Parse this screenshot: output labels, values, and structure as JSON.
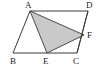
{
  "figure": {
    "background_color": "#ffffff",
    "stroke_color": "#3a3a3a",
    "shade_color": "#c9c9c9",
    "shade_stroke_color": "#555555",
    "stroke_width": 1,
    "canvas": {
      "width": 103,
      "height": 70
    },
    "points": {
      "A": {
        "x": 30,
        "y": 11,
        "label": "A",
        "label_x": 25,
        "label_y": 1
      },
      "B": {
        "x": 13,
        "y": 53,
        "label": "B",
        "label_x": 10,
        "label_y": 57
      },
      "C": {
        "x": 77,
        "y": 53,
        "label": "C",
        "label_x": 73,
        "label_y": 57
      },
      "D": {
        "x": 88,
        "y": 11,
        "label": "D",
        "label_x": 86,
        "label_y": 1
      },
      "E": {
        "x": 47,
        "y": 53,
        "label": "E",
        "label_x": 43,
        "label_y": 57
      },
      "F": {
        "x": 84,
        "y": 35,
        "label": "F",
        "label_x": 87,
        "label_y": 31
      }
    },
    "outline_polygon": "30,11 88,11 77,53 13,53",
    "shaded_polygon": "30,11 84,35 47,53",
    "segments": [
      {
        "name": "AB",
        "from": "A",
        "to": "B"
      },
      {
        "name": "AD",
        "from": "A",
        "to": "D"
      },
      {
        "name": "DC",
        "from": "D",
        "to": "C"
      },
      {
        "name": "BC",
        "from": "B",
        "to": "C"
      },
      {
        "name": "AE",
        "from": "A",
        "to": "E"
      },
      {
        "name": "AF",
        "from": "A",
        "to": "F"
      },
      {
        "name": "EF",
        "from": "E",
        "to": "F"
      }
    ]
  }
}
